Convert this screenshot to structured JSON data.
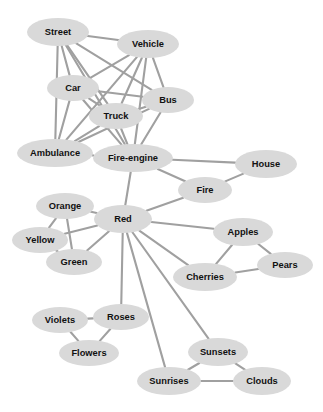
{
  "diagram": {
    "type": "node-link-graph",
    "layout": "undirected force-directed",
    "canvas": {
      "width": 323,
      "height": 412,
      "background": "#ffffff"
    },
    "style": {
      "node_fill": "#d9d9d9",
      "node_text_color": "#111111",
      "edge_color": "#a0a0a0",
      "edge_width": 2.1,
      "node_shape": "ellipse"
    },
    "nodes": [
      {
        "id": "street",
        "label": "Street",
        "x": 58,
        "y": 32,
        "rx": 31,
        "ry": 14
      },
      {
        "id": "vehicle",
        "label": "Vehicle",
        "x": 148,
        "y": 44,
        "rx": 31,
        "ry": 14
      },
      {
        "id": "car",
        "label": "Car",
        "x": 73,
        "y": 88,
        "rx": 26,
        "ry": 13
      },
      {
        "id": "bus",
        "label": "Bus",
        "x": 168,
        "y": 100,
        "rx": 26,
        "ry": 13
      },
      {
        "id": "truck",
        "label": "Truck",
        "x": 116,
        "y": 116,
        "rx": 27,
        "ry": 13
      },
      {
        "id": "ambulance",
        "label": "Ambulance",
        "x": 55,
        "y": 153,
        "rx": 38,
        "ry": 14
      },
      {
        "id": "fire-engine",
        "label": "Fire-engine",
        "x": 133,
        "y": 158,
        "rx": 40,
        "ry": 14
      },
      {
        "id": "house",
        "label": "House",
        "x": 266,
        "y": 164,
        "rx": 31,
        "ry": 14
      },
      {
        "id": "fire",
        "label": "Fire",
        "x": 205,
        "y": 190,
        "rx": 27,
        "ry": 13
      },
      {
        "id": "orange",
        "label": "Orange",
        "x": 65,
        "y": 206,
        "rx": 29,
        "ry": 13
      },
      {
        "id": "red",
        "label": "Red",
        "x": 123,
        "y": 219,
        "rx": 29,
        "ry": 14
      },
      {
        "id": "yellow",
        "label": "Yellow",
        "x": 40,
        "y": 240,
        "rx": 28,
        "ry": 13
      },
      {
        "id": "apples",
        "label": "Apples",
        "x": 243,
        "y": 232,
        "rx": 30,
        "ry": 14
      },
      {
        "id": "green",
        "label": "Green",
        "x": 74,
        "y": 262,
        "rx": 28,
        "ry": 13
      },
      {
        "id": "pears",
        "label": "Pears",
        "x": 285,
        "y": 265,
        "rx": 28,
        "ry": 13
      },
      {
        "id": "cherries",
        "label": "Cherries",
        "x": 205,
        "y": 277,
        "rx": 32,
        "ry": 14
      },
      {
        "id": "violets",
        "label": "Violets",
        "x": 60,
        "y": 320,
        "rx": 28,
        "ry": 13
      },
      {
        "id": "roses",
        "label": "Roses",
        "x": 121,
        "y": 317,
        "rx": 28,
        "ry": 13
      },
      {
        "id": "flowers",
        "label": "Flowers",
        "x": 89,
        "y": 353,
        "rx": 30,
        "ry": 13
      },
      {
        "id": "sunsets",
        "label": "Sunsets",
        "x": 218,
        "y": 352,
        "rx": 30,
        "ry": 14
      },
      {
        "id": "sunrises",
        "label": "Sunrises",
        "x": 169,
        "y": 381,
        "rx": 32,
        "ry": 14
      },
      {
        "id": "clouds",
        "label": "Clouds",
        "x": 262,
        "y": 381,
        "rx": 29,
        "ry": 14
      }
    ],
    "edges": [
      {
        "source": "street",
        "target": "vehicle"
      },
      {
        "source": "street",
        "target": "car"
      },
      {
        "source": "street",
        "target": "truck"
      },
      {
        "source": "street",
        "target": "bus"
      },
      {
        "source": "street",
        "target": "ambulance"
      },
      {
        "source": "street",
        "target": "fire-engine"
      },
      {
        "source": "vehicle",
        "target": "car"
      },
      {
        "source": "vehicle",
        "target": "truck"
      },
      {
        "source": "vehicle",
        "target": "bus"
      },
      {
        "source": "vehicle",
        "target": "ambulance"
      },
      {
        "source": "vehicle",
        "target": "fire-engine"
      },
      {
        "source": "car",
        "target": "truck"
      },
      {
        "source": "car",
        "target": "bus"
      },
      {
        "source": "car",
        "target": "ambulance"
      },
      {
        "source": "car",
        "target": "fire-engine"
      },
      {
        "source": "truck",
        "target": "bus"
      },
      {
        "source": "truck",
        "target": "ambulance"
      },
      {
        "source": "truck",
        "target": "fire-engine"
      },
      {
        "source": "bus",
        "target": "ambulance"
      },
      {
        "source": "bus",
        "target": "fire-engine"
      },
      {
        "source": "ambulance",
        "target": "fire-engine"
      },
      {
        "source": "fire-engine",
        "target": "house"
      },
      {
        "source": "fire-engine",
        "target": "fire"
      },
      {
        "source": "fire-engine",
        "target": "red"
      },
      {
        "source": "fire",
        "target": "house"
      },
      {
        "source": "fire",
        "target": "red"
      },
      {
        "source": "red",
        "target": "orange"
      },
      {
        "source": "red",
        "target": "yellow"
      },
      {
        "source": "red",
        "target": "green"
      },
      {
        "source": "red",
        "target": "apples"
      },
      {
        "source": "red",
        "target": "cherries"
      },
      {
        "source": "red",
        "target": "roses"
      },
      {
        "source": "red",
        "target": "sunsets"
      },
      {
        "source": "red",
        "target": "sunrises"
      },
      {
        "source": "orange",
        "target": "yellow"
      },
      {
        "source": "orange",
        "target": "green"
      },
      {
        "source": "yellow",
        "target": "green"
      },
      {
        "source": "apples",
        "target": "pears"
      },
      {
        "source": "apples",
        "target": "cherries"
      },
      {
        "source": "cherries",
        "target": "pears"
      },
      {
        "source": "violets",
        "target": "roses"
      },
      {
        "source": "violets",
        "target": "flowers"
      },
      {
        "source": "roses",
        "target": "flowers"
      },
      {
        "source": "sunsets",
        "target": "sunrises"
      },
      {
        "source": "sunsets",
        "target": "clouds"
      },
      {
        "source": "sunrises",
        "target": "clouds"
      }
    ]
  }
}
